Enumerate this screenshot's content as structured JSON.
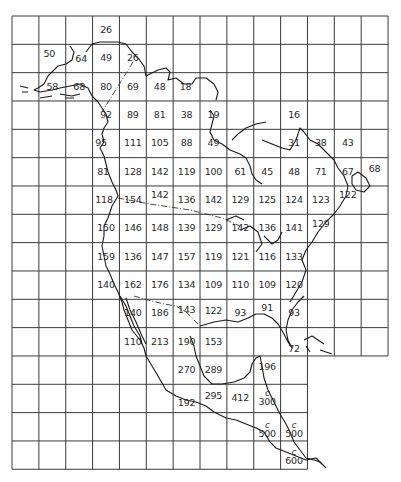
{
  "map": {
    "subject": "North America grid map with numeric values per cell",
    "grid": {
      "left": 12,
      "top": 16,
      "col_width": 26.86,
      "row_height": 28.33,
      "full_cols": 14,
      "full_rows": 12,
      "lower_cols": 11,
      "lower_rows": 4
    },
    "cells": [
      {
        "row": 0,
        "col": 3,
        "value": "26"
      },
      {
        "row": 1,
        "col": 1,
        "value": "50",
        "dx": -3,
        "dy": -4
      },
      {
        "row": 1,
        "col": 2,
        "value": "64",
        "dx": 2,
        "dy": 1
      },
      {
        "row": 1,
        "col": 3,
        "value": "49"
      },
      {
        "row": 1,
        "col": 4,
        "value": "26"
      },
      {
        "row": 2,
        "col": 1,
        "value": "58"
      },
      {
        "row": 2,
        "col": 2,
        "value": "68"
      },
      {
        "row": 2,
        "col": 3,
        "value": "80"
      },
      {
        "row": 2,
        "col": 4,
        "value": "69"
      },
      {
        "row": 2,
        "col": 5,
        "value": "48"
      },
      {
        "row": 2,
        "col": 6,
        "value": "18",
        "dx": -1
      },
      {
        "row": 3,
        "col": 3,
        "value": "92"
      },
      {
        "row": 3,
        "col": 4,
        "value": "89"
      },
      {
        "row": 3,
        "col": 5,
        "value": "81"
      },
      {
        "row": 3,
        "col": 6,
        "value": "38"
      },
      {
        "row": 3,
        "col": 7,
        "value": "19"
      },
      {
        "row": 3,
        "col": 10,
        "value": "16"
      },
      {
        "row": 4,
        "col": 3,
        "value": "95",
        "dx": -5
      },
      {
        "row": 4,
        "col": 4,
        "value": "111"
      },
      {
        "row": 4,
        "col": 5,
        "value": "105"
      },
      {
        "row": 4,
        "col": 6,
        "value": "88"
      },
      {
        "row": 4,
        "col": 7,
        "value": "49"
      },
      {
        "row": 4,
        "col": 10,
        "value": "31"
      },
      {
        "row": 4,
        "col": 11,
        "value": "38"
      },
      {
        "row": 4,
        "col": 12,
        "value": "43"
      },
      {
        "row": 5,
        "col": 3,
        "value": "81",
        "dx": -3
      },
      {
        "row": 5,
        "col": 4,
        "value": "128"
      },
      {
        "row": 5,
        "col": 5,
        "value": "142"
      },
      {
        "row": 5,
        "col": 6,
        "value": "119"
      },
      {
        "row": 5,
        "col": 7,
        "value": "100"
      },
      {
        "row": 5,
        "col": 8,
        "value": "61"
      },
      {
        "row": 5,
        "col": 9,
        "value": "45"
      },
      {
        "row": 5,
        "col": 10,
        "value": "48"
      },
      {
        "row": 5,
        "col": 11,
        "value": "71"
      },
      {
        "row": 5,
        "col": 12,
        "value": "67"
      },
      {
        "row": 5,
        "col": 13,
        "value": "68",
        "dy": -3
      },
      {
        "row": 6,
        "col": 3,
        "value": "118",
        "dx": -2
      },
      {
        "row": 6,
        "col": 4,
        "value": "154"
      },
      {
        "row": 6,
        "col": 5,
        "value": "142",
        "dy": -5
      },
      {
        "row": 6,
        "col": 6,
        "value": "136"
      },
      {
        "row": 6,
        "col": 7,
        "value": "142"
      },
      {
        "row": 6,
        "col": 8,
        "value": "129"
      },
      {
        "row": 6,
        "col": 9,
        "value": "125"
      },
      {
        "row": 6,
        "col": 10,
        "value": "124"
      },
      {
        "row": 6,
        "col": 11,
        "value": "123"
      },
      {
        "row": 6,
        "col": 12,
        "value": "122",
        "dy": -5
      },
      {
        "row": 7,
        "col": 3,
        "value": "150"
      },
      {
        "row": 7,
        "col": 4,
        "value": "146"
      },
      {
        "row": 7,
        "col": 5,
        "value": "148"
      },
      {
        "row": 7,
        "col": 6,
        "value": "139"
      },
      {
        "row": 7,
        "col": 7,
        "value": "129"
      },
      {
        "row": 7,
        "col": 8,
        "value": "142"
      },
      {
        "row": 7,
        "col": 9,
        "value": "136"
      },
      {
        "row": 7,
        "col": 10,
        "value": "141"
      },
      {
        "row": 7,
        "col": 11,
        "value": "129",
        "dy": -4
      },
      {
        "row": 8,
        "col": 3,
        "value": "159"
      },
      {
        "row": 8,
        "col": 4,
        "value": "136"
      },
      {
        "row": 8,
        "col": 5,
        "value": "147"
      },
      {
        "row": 8,
        "col": 6,
        "value": "157"
      },
      {
        "row": 8,
        "col": 7,
        "value": "119"
      },
      {
        "row": 8,
        "col": 8,
        "value": "121"
      },
      {
        "row": 8,
        "col": 9,
        "value": "116"
      },
      {
        "row": 8,
        "col": 10,
        "value": "133"
      },
      {
        "row": 9,
        "col": 3,
        "value": "140"
      },
      {
        "row": 9,
        "col": 4,
        "value": "162"
      },
      {
        "row": 9,
        "col": 5,
        "value": "176"
      },
      {
        "row": 9,
        "col": 6,
        "value": "134"
      },
      {
        "row": 9,
        "col": 7,
        "value": "109"
      },
      {
        "row": 9,
        "col": 8,
        "value": "110"
      },
      {
        "row": 9,
        "col": 9,
        "value": "109"
      },
      {
        "row": 9,
        "col": 10,
        "value": "120"
      },
      {
        "row": 10,
        "col": 4,
        "value": "140"
      },
      {
        "row": 10,
        "col": 5,
        "value": "186"
      },
      {
        "row": 10,
        "col": 6,
        "value": "143",
        "dy": -3
      },
      {
        "row": 10,
        "col": 7,
        "value": "122",
        "dy": -2
      },
      {
        "row": 10,
        "col": 8,
        "value": "93"
      },
      {
        "row": 10,
        "col": 9,
        "value": "91",
        "dy": -5
      },
      {
        "row": 10,
        "col": 10,
        "value": "93"
      },
      {
        "row": 11,
        "col": 4,
        "value": "110"
      },
      {
        "row": 11,
        "col": 5,
        "value": "213"
      },
      {
        "row": 11,
        "col": 6,
        "value": "190"
      },
      {
        "row": 11,
        "col": 7,
        "value": "153"
      },
      {
        "row": 11,
        "col": 10,
        "value": "72",
        "dy": 7
      },
      {
        "row": 12,
        "col": 6,
        "value": "270"
      },
      {
        "row": 12,
        "col": 7,
        "value": "289"
      },
      {
        "row": 12,
        "col": 9,
        "value": "196",
        "dy": -3
      },
      {
        "row": 13,
        "col": 6,
        "value": "192",
        "dy": 5
      },
      {
        "row": 13,
        "col": 7,
        "value": "295",
        "dy": -2
      },
      {
        "row": 13,
        "col": 8,
        "value": "412"
      },
      {
        "row": 13,
        "col": 9,
        "value": "300",
        "prefix": "c"
      },
      {
        "row": 14,
        "col": 9,
        "value": "500",
        "prefix": "c",
        "dy": 3
      },
      {
        "row": 14,
        "col": 10,
        "value": "500",
        "prefix": "c",
        "dy": 3
      },
      {
        "row": 15,
        "col": 10,
        "value": "600",
        "prefix": "c",
        "dy": 2
      }
    ]
  }
}
